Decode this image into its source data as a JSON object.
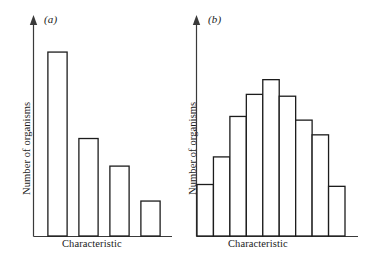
{
  "figure": {
    "background_color": "#ffffff",
    "ink_color": "#1c1c1c"
  },
  "panels": [
    {
      "id": "a",
      "label": "(a)",
      "ylabel": "Number of organisms",
      "xlabel": "Characteristic"
    },
    {
      "id": "b",
      "label": "(b)",
      "ylabel": "Number of organisms",
      "xlabel": "Characteristic"
    }
  ],
  "chart_data": [
    {
      "type": "bar",
      "panel": "a",
      "title": "(a)",
      "xlabel": "Characteristic",
      "ylabel": "Number of organisms",
      "categories": [
        "1",
        "2",
        "3",
        "4"
      ],
      "values": [
        1.0,
        0.53,
        0.38,
        0.19
      ],
      "ylim": [
        0,
        1.12
      ],
      "grid": false,
      "legend": "none",
      "bar_style": "separated",
      "fill": "#ffffff",
      "stroke": "#1c1c1c",
      "note": "Discontinuous variation: a few discrete classes with sharply different frequencies"
    },
    {
      "type": "bar",
      "panel": "b",
      "title": "(b)",
      "xlabel": "Characteristic",
      "ylabel": "Number of organisms",
      "categories": [
        "1",
        "2",
        "3",
        "4",
        "5",
        "6",
        "7",
        "8",
        "9"
      ],
      "values": [
        0.28,
        0.43,
        0.65,
        0.77,
        0.85,
        0.76,
        0.63,
        0.55,
        0.27
      ],
      "ylim": [
        0,
        1.12
      ],
      "grid": false,
      "legend": "none",
      "bar_style": "contiguous",
      "fill": "#ffffff",
      "stroke": "#1c1c1c",
      "note": "Continuous variation: adjoining classes forming a roughly bell-shaped distribution"
    }
  ]
}
